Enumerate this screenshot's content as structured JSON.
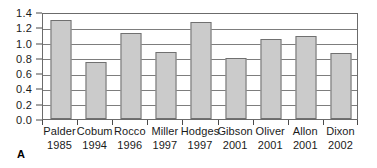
{
  "panel": {
    "letter": "A"
  },
  "chart_data": {
    "type": "bar",
    "title": "",
    "subtitle": "",
    "xlabel": "",
    "ylabel": "",
    "ylim": [
      0.0,
      1.4
    ],
    "ytick_step": 0.2,
    "grid": true,
    "gridlines_horizontal": true,
    "gridlines_vertical": false,
    "legend": false,
    "legend_position": "none",
    "bar_fill_color": "#cbcbcb",
    "bar_border_color": "#707070",
    "axis_color": "#6b6b6b",
    "background_color": "#ffffff",
    "ytick_labels": [
      "0.0",
      "0.2",
      "0.4",
      "0.6",
      "0.8",
      "1.0",
      "1.2",
      "1.4"
    ],
    "ytick_values": [
      0.0,
      0.2,
      0.4,
      0.6,
      0.8,
      1.0,
      1.2,
      1.4
    ],
    "categories": [
      "Palder 1985",
      "Cobum 1994",
      "Rocco 1996",
      "Miller 1997",
      "Hodges 1997",
      "Gibson 2001",
      "Oliver 2001",
      "Allon 2001",
      "Dixon 2002"
    ],
    "category_names": [
      "Palder",
      "Cobum",
      "Rocco",
      "Miller",
      "Hodges",
      "Gibson",
      "Oliver",
      "Allon",
      "Dixon"
    ],
    "category_years": [
      "1985",
      "1994",
      "1996",
      "1997",
      "1997",
      "2001",
      "2001",
      "2001",
      "2002"
    ],
    "values": [
      1.3,
      0.74,
      1.13,
      0.875,
      1.27,
      0.795,
      1.05,
      1.09,
      0.865
    ]
  }
}
